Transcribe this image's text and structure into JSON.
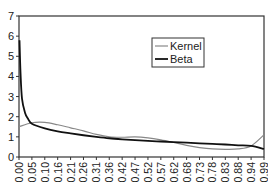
{
  "chart_data": {
    "type": "line",
    "title": "",
    "xlabel": "",
    "ylabel": "",
    "ylim": [
      0,
      7
    ],
    "yticks": [
      0,
      1,
      2,
      3,
      4,
      5,
      6,
      7
    ],
    "grid": false,
    "legend_position": "upper-right-inset",
    "categories": [
      "0.00",
      "0.05",
      "0.10",
      "0.16",
      "0.21",
      "0.26",
      "0.31",
      "0.36",
      "0.42",
      "0.47",
      "0.52",
      "0.57",
      "0.62",
      "0.68",
      "0.73",
      "0.78",
      "0.83",
      "0.88",
      "0.94",
      "0.99"
    ],
    "series": [
      {
        "name": "Kernel",
        "color": "#888888",
        "values": [
          1.5,
          1.7,
          1.72,
          1.6,
          1.45,
          1.3,
          1.12,
          1.0,
          0.98,
          1.0,
          0.95,
          0.85,
          0.72,
          0.58,
          0.47,
          0.4,
          0.38,
          0.4,
          0.55,
          1.1
        ]
      },
      {
        "name": "Beta",
        "color": "#111111",
        "values": [
          3.2,
          1.65,
          1.42,
          1.27,
          1.17,
          1.08,
          1.0,
          0.93,
          0.88,
          0.84,
          0.8,
          0.77,
          0.74,
          0.71,
          0.68,
          0.65,
          0.62,
          0.58,
          0.55,
          0.4
        ]
      }
    ],
    "beta_spike_at_zero": 5.8
  },
  "legend": {
    "items": [
      {
        "label": "Kernel"
      },
      {
        "label": "Beta"
      }
    ]
  }
}
